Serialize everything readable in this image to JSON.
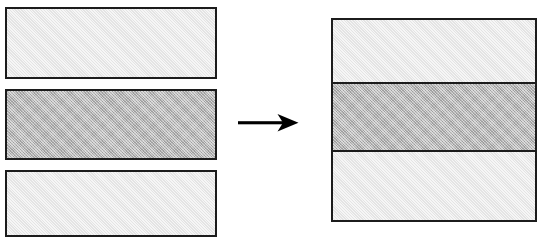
{
  "figure": {
    "background_color": "#ffffff",
    "stroke_color": "#1c1c1c",
    "stroke_width_px": 2
  },
  "palette": {
    "light_fill": "#ececec",
    "dark_fill": "#b9b9b9",
    "outline": "#1c1c1c",
    "page": "#ffffff"
  },
  "left_group": {
    "name": "exploded-layers",
    "label": "",
    "layer_count": 3,
    "layers": [
      {
        "index": 1,
        "name": "top-layer",
        "label": "",
        "fill": "light",
        "fill_color": "#ececec",
        "x": 5,
        "y": 7,
        "width": 212,
        "height": 72
      },
      {
        "index": 2,
        "name": "middle-layer",
        "label": "",
        "fill": "dark",
        "fill_color": "#b9b9b9",
        "x": 5,
        "y": 89,
        "width": 212,
        "height": 71
      },
      {
        "index": 3,
        "name": "bottom-layer",
        "label": "",
        "fill": "light",
        "fill_color": "#ececec",
        "x": 5,
        "y": 170,
        "width": 212,
        "height": 67
      }
    ]
  },
  "arrow": {
    "name": "transformation-arrow",
    "label": "",
    "glyph": "right-arrow-icon",
    "direction": "right",
    "x": 238,
    "y": 108,
    "width": 62,
    "height": 31,
    "color": "#000000"
  },
  "right_group": {
    "name": "assembled-stack",
    "label": "",
    "band_count": 3,
    "x": 331,
    "y": 18,
    "width": 206,
    "height": 204,
    "bands": [
      {
        "index": 1,
        "name": "top-band",
        "label": "",
        "fill": "light",
        "fill_color": "#ececec",
        "height": 64
      },
      {
        "index": 2,
        "name": "middle-band",
        "label": "",
        "fill": "dark",
        "fill_color": "#b9b9b9",
        "height": 68
      },
      {
        "index": 3,
        "name": "bottom-band",
        "label": "",
        "fill": "light",
        "fill_color": "#ececec",
        "height": 68
      }
    ]
  }
}
